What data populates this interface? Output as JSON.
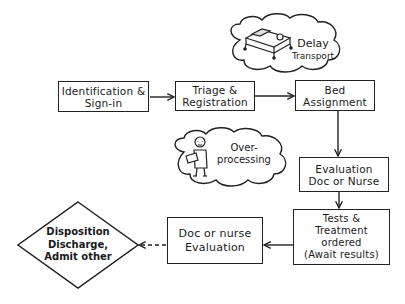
{
  "diagram": {
    "type": "flowchart",
    "style": "hand-drawn sketch",
    "nodes": [
      {
        "id": "identification",
        "shape": "rect",
        "lines": [
          "Identification &",
          "Sign-in"
        ]
      },
      {
        "id": "triage",
        "shape": "rect",
        "lines": [
          "Triage &",
          "Registration"
        ]
      },
      {
        "id": "bed",
        "shape": "rect",
        "lines": [
          "Bed",
          "Assignment"
        ]
      },
      {
        "id": "evaluation1",
        "shape": "rect",
        "lines": [
          "Evaluation",
          "Doc or Nurse"
        ]
      },
      {
        "id": "tests",
        "shape": "rect",
        "lines": [
          "Tests &",
          "Treatment",
          "ordered",
          "(Await results)"
        ]
      },
      {
        "id": "evaluation2",
        "shape": "rect",
        "lines": [
          "Doc or nurse",
          "Evaluation"
        ]
      },
      {
        "id": "disposition",
        "shape": "diamond",
        "lines": [
          "Disposition",
          "Discharge,",
          "Admit other"
        ]
      }
    ],
    "clouds": [
      {
        "id": "delay-transport",
        "lines": [
          "Delay",
          "Transport"
        ],
        "icon": "hospital-bed-icon"
      },
      {
        "id": "over-processing",
        "lines": [
          "Over-",
          "processing"
        ],
        "icon": "person-with-clipboard-icon"
      }
    ],
    "edges": [
      {
        "from": "identification",
        "to": "triage",
        "style": "solid"
      },
      {
        "from": "triage",
        "to": "bed",
        "style": "solid"
      },
      {
        "from": "bed",
        "to": "evaluation1",
        "style": "solid"
      },
      {
        "from": "evaluation1",
        "to": "tests",
        "style": "solid"
      },
      {
        "from": "tests",
        "to": "evaluation2",
        "style": "solid"
      },
      {
        "from": "evaluation2",
        "to": "disposition",
        "style": "dashed"
      }
    ]
  }
}
